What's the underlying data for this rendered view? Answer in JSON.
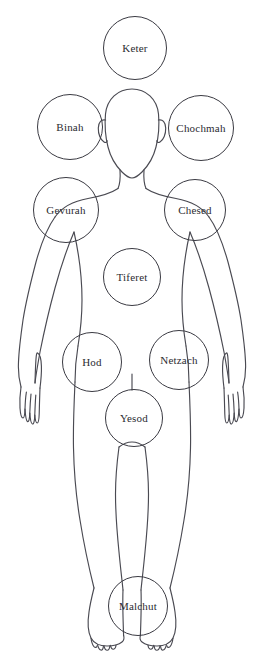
{
  "diagram": {
    "canvas": {
      "width": 263,
      "height": 668
    },
    "colors": {
      "background": "#ffffff",
      "outline": "#4a4a52",
      "circle_stroke": "#3a3a42",
      "label_text": "#2b2b31"
    },
    "figure_name": "human-body-outline"
  },
  "sephirot": [
    {
      "id": "keter",
      "label": "Keter",
      "cx": 135,
      "cy": 48,
      "r": 32,
      "font_size": 11,
      "body_location": "above-head"
    },
    {
      "id": "binah",
      "label": "Binah",
      "cx": 70,
      "cy": 127,
      "r": 33,
      "font_size": 11,
      "body_location": "left-of-head"
    },
    {
      "id": "chochmah",
      "label": "Chochmah",
      "cx": 201,
      "cy": 128,
      "r": 33,
      "font_size": 11,
      "body_location": "right-of-head"
    },
    {
      "id": "gevurah",
      "label": "Gevurah",
      "cx": 66,
      "cy": 210,
      "r": 33,
      "font_size": 11,
      "body_location": "left-shoulder"
    },
    {
      "id": "chesed",
      "label": "Chesed",
      "cx": 195,
      "cy": 210,
      "r": 31,
      "font_size": 11,
      "body_location": "right-shoulder"
    },
    {
      "id": "tiferet",
      "label": "Tiferet",
      "cx": 132,
      "cy": 277,
      "r": 29,
      "font_size": 11,
      "body_location": "chest-center"
    },
    {
      "id": "hod",
      "label": "Hod",
      "cx": 92,
      "cy": 362,
      "r": 30,
      "font_size": 11,
      "body_location": "left-hip"
    },
    {
      "id": "netzach",
      "label": "Netzach",
      "cx": 179,
      "cy": 360,
      "r": 30,
      "font_size": 11,
      "body_location": "right-hip"
    },
    {
      "id": "yesod",
      "label": "Yesod",
      "cx": 134,
      "cy": 418,
      "r": 29,
      "font_size": 11,
      "body_location": "pelvis"
    },
    {
      "id": "malchut",
      "label": "Malchut",
      "cx": 138,
      "cy": 606,
      "r": 30,
      "font_size": 11,
      "body_location": "feet"
    }
  ],
  "connectors": [
    {
      "id": "hod-yesod",
      "from": "hod",
      "to": "yesod"
    },
    {
      "id": "netzach-yesod",
      "from": "netzach",
      "to": "yesod"
    }
  ]
}
